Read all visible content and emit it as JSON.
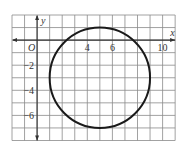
{
  "chart_data": {
    "type": "scatter",
    "title": "",
    "xlabel": "x",
    "ylabel": "y",
    "xlim": [
      -2,
      11
    ],
    "ylim": [
      -8,
      2
    ],
    "grid": true,
    "origin_label": "O",
    "x_tick_labels": [
      {
        "value": 4,
        "label": "4"
      },
      {
        "value": 6,
        "label": "6"
      },
      {
        "value": 10,
        "label": "10"
      }
    ],
    "y_tick_labels": [
      {
        "value": -2,
        "label": "−2"
      },
      {
        "value": -4,
        "label": "−4"
      },
      {
        "value": -6,
        "label": "−6"
      }
    ],
    "shapes": [
      {
        "shape": "circle",
        "center": [
          5,
          -3
        ],
        "radius": 4,
        "stroke": "#1a1a1a"
      }
    ]
  },
  "colors": {
    "grid": "#8a8a8a",
    "axis": "#333333",
    "curve": "#1a1a1a"
  }
}
